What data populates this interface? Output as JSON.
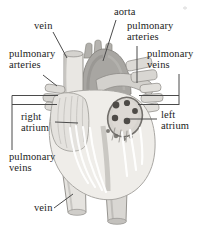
{
  "figure": {
    "labels": {
      "vein_top": "vein",
      "aorta": "aorta",
      "pulmonary_arteries_upper_right": "pulmonary\narteries",
      "pulmonary_arteries_left": "pulmonary\narteries",
      "pulmonary_veins_right": "pulmonary\nveins",
      "right_atrium": "right\natrium",
      "left_atrium": "left\natrium",
      "pulmonary_veins_lower_left": "pulmonary\nveins",
      "vein_bottom": "vein"
    }
  },
  "colors": {
    "background": "#ffffff",
    "label_text": "#1c1c1c",
    "leader_line": "#4b4b4b"
  }
}
